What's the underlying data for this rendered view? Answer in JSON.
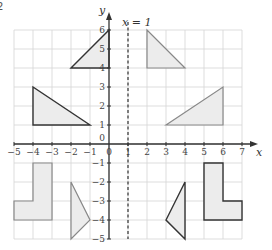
{
  "diagram": {
    "question_number_fragment": "2",
    "axes": {
      "x_label": "x",
      "y_label": "y",
      "x_min": -5,
      "x_max": 7,
      "y_min": -5,
      "y_max": 6,
      "x_ticks": [
        "-5",
        "-4",
        "-3",
        "-2",
        "-1",
        "0",
        "1",
        "2",
        "3",
        "4",
        "5",
        "6",
        "7"
      ],
      "y_ticks": [
        "-5",
        "-4",
        "-3",
        "-2",
        "-1",
        "0",
        "1",
        "2",
        "3",
        "4",
        "5",
        "6"
      ],
      "origin_label": "0"
    },
    "mirror_line": {
      "label": "x = 1",
      "x": 1,
      "style": "dashed"
    },
    "shapes": [
      {
        "id": "triangle-A",
        "quadrant": "top-left",
        "outline": "dark",
        "points": [
          [
            -2,
            4
          ],
          [
            0,
            6
          ],
          [
            0,
            4
          ]
        ]
      },
      {
        "id": "triangle-B",
        "quadrant": "top-right",
        "outline": "light",
        "points": [
          [
            2,
            6
          ],
          [
            2,
            4
          ],
          [
            4,
            4
          ]
        ]
      },
      {
        "id": "triangle-C",
        "quadrant": "left",
        "outline": "dark",
        "points": [
          [
            -4,
            3
          ],
          [
            -4,
            1
          ],
          [
            -1,
            1
          ]
        ]
      },
      {
        "id": "triangle-D",
        "quadrant": "right",
        "outline": "light",
        "points": [
          [
            3,
            1
          ],
          [
            6,
            3
          ],
          [
            6,
            1
          ]
        ]
      },
      {
        "id": "L-shape-E",
        "quadrant": "bottom-left",
        "outline": "light",
        "points": [
          [
            -4,
            -1
          ],
          [
            -3,
            -1
          ],
          [
            -3,
            -4
          ],
          [
            -5,
            -4
          ],
          [
            -5,
            -3
          ],
          [
            -4,
            -3
          ]
        ]
      },
      {
        "id": "triangle-F",
        "quadrant": "bottom-left",
        "outline": "light",
        "points": [
          [
            -2,
            -2
          ],
          [
            -1,
            -4
          ],
          [
            -2,
            -5
          ]
        ]
      },
      {
        "id": "triangle-G",
        "quadrant": "bottom-right",
        "outline": "dark",
        "points": [
          [
            4,
            -2
          ],
          [
            3,
            -4
          ],
          [
            4,
            -5
          ]
        ]
      },
      {
        "id": "L-shape-H",
        "quadrant": "bottom-right",
        "outline": "dark",
        "points": [
          [
            5,
            -1
          ],
          [
            6,
            -1
          ],
          [
            6,
            -3
          ],
          [
            7,
            -3
          ],
          [
            7,
            -4
          ],
          [
            5,
            -4
          ]
        ]
      }
    ]
  }
}
